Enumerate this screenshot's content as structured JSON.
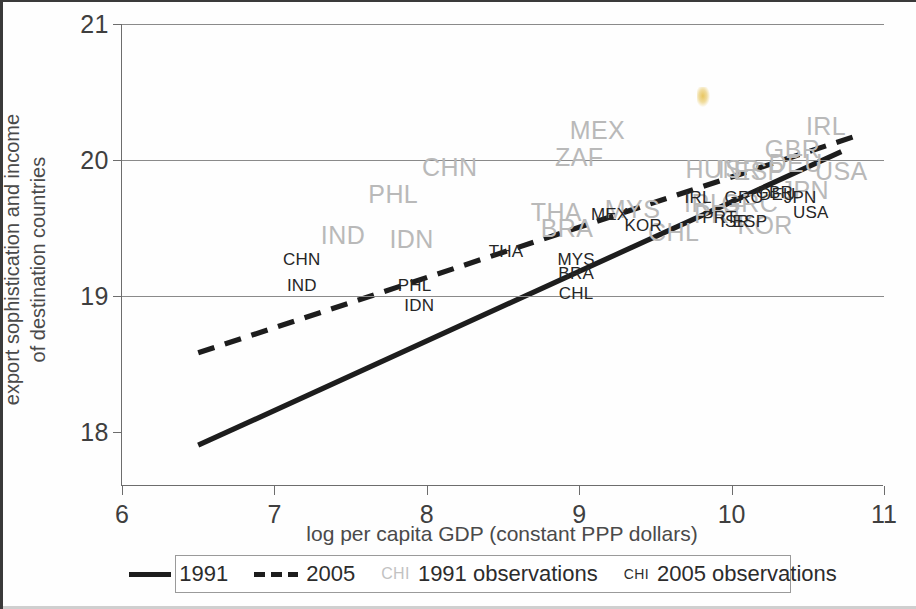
{
  "chart_data": {
    "type": "scatter",
    "title": "",
    "xlabel": "log per capita GDP (constant PPP dollars)",
    "ylabel": "export sophistication and income\nof destination countries",
    "ylabel_line1": "export sophistication and income",
    "ylabel_line2": "of destination countries",
    "xlim": [
      6,
      11
    ],
    "ylim": [
      17.6,
      21
    ],
    "xticks": [
      "6",
      "7",
      "8",
      "9",
      "10",
      "11"
    ],
    "yticks": [
      "18",
      "19",
      "20",
      "21"
    ],
    "gridlines": [
      "19",
      "20",
      "21"
    ],
    "grid": true,
    "legend_position": "below-plot",
    "colors": {
      "series_1991_line": "#1d1d1d",
      "series_2005_line": "#1d1d1d",
      "labels_1991": "#b9b9b9",
      "labels_2005": "#262626",
      "axis": "#6d6d6d",
      "grid": "#8a8a8a",
      "frame": "#3a3a3a"
    },
    "series": [
      {
        "name": "1991",
        "style": "solid",
        "type": "line",
        "x": [
          6.5,
          10.72
        ],
        "y": [
          17.9,
          20.06
        ]
      },
      {
        "name": "2005",
        "style": "dashed",
        "type": "line",
        "x": [
          6.5,
          10.8
        ],
        "y": [
          18.58,
          20.17
        ]
      },
      {
        "name": "1991 observations",
        "type": "text-scatter",
        "color": "#b9b9b9",
        "points": [
          {
            "label": "CHN",
            "x": 8.15,
            "y": 19.95
          },
          {
            "label": "PHL",
            "x": 7.78,
            "y": 19.75
          },
          {
            "label": "IND",
            "x": 7.45,
            "y": 19.45
          },
          {
            "label": "IDN",
            "x": 7.9,
            "y": 19.42
          },
          {
            "label": "MEX",
            "x": 9.12,
            "y": 20.22
          },
          {
            "label": "ZAF",
            "x": 9.0,
            "y": 20.02
          },
          {
            "label": "THA",
            "x": 8.85,
            "y": 19.62
          },
          {
            "label": "BRA",
            "x": 8.92,
            "y": 19.5
          },
          {
            "label": "MYS",
            "x": 9.35,
            "y": 19.64
          },
          {
            "label": "CHL",
            "x": 9.62,
            "y": 19.47
          },
          {
            "label": "IRL",
            "x": 9.82,
            "y": 19.68
          },
          {
            "label": "PRT",
            "x": 9.92,
            "y": 19.6
          },
          {
            "label": "HUN",
            "x": 9.88,
            "y": 19.93
          },
          {
            "label": "ISR",
            "x": 10.05,
            "y": 19.93
          },
          {
            "label": "ESP",
            "x": 10.18,
            "y": 19.92
          },
          {
            "label": "KOR",
            "x": 10.22,
            "y": 19.52
          },
          {
            "label": "GRC",
            "x": 10.12,
            "y": 19.68
          },
          {
            "label": "DEU",
            "x": 10.42,
            "y": 19.98
          },
          {
            "label": "GBR",
            "x": 10.4,
            "y": 20.08
          },
          {
            "label": "IRL",
            "x": 10.62,
            "y": 20.25
          },
          {
            "label": "USA",
            "x": 10.72,
            "y": 19.92
          },
          {
            "label": "JPN",
            "x": 10.48,
            "y": 19.78
          }
        ]
      },
      {
        "name": "2005 observations",
        "type": "text-scatter",
        "color": "#262626",
        "points": [
          {
            "label": "CHN",
            "x": 7.18,
            "y": 19.27
          },
          {
            "label": "IND",
            "x": 7.18,
            "y": 19.08
          },
          {
            "label": "PHL",
            "x": 7.92,
            "y": 19.08
          },
          {
            "label": "IDN",
            "x": 7.95,
            "y": 18.93
          },
          {
            "label": "THA",
            "x": 8.52,
            "y": 19.33
          },
          {
            "label": "MYS",
            "x": 8.98,
            "y": 19.27
          },
          {
            "label": "BRA",
            "x": 8.98,
            "y": 19.17
          },
          {
            "label": "CHL",
            "x": 8.98,
            "y": 19.02
          },
          {
            "label": "MEX",
            "x": 9.2,
            "y": 19.6
          },
          {
            "label": "KOR",
            "x": 9.42,
            "y": 19.52
          },
          {
            "label": "IRL",
            "x": 9.78,
            "y": 19.73
          },
          {
            "label": "PRT",
            "x": 9.92,
            "y": 19.58
          },
          {
            "label": "ISR",
            "x": 10.02,
            "y": 19.55
          },
          {
            "label": "ESP",
            "x": 10.12,
            "y": 19.55
          },
          {
            "label": "GRC",
            "x": 10.08,
            "y": 19.73
          },
          {
            "label": "DEU",
            "x": 10.3,
            "y": 19.75
          },
          {
            "label": "GBR",
            "x": 10.28,
            "y": 19.76
          },
          {
            "label": "JPN",
            "x": 10.45,
            "y": 19.73
          },
          {
            "label": "USA",
            "x": 10.52,
            "y": 19.62
          }
        ]
      }
    ]
  },
  "legend": {
    "items": [
      {
        "swatch": "solid-line",
        "label": "1991"
      },
      {
        "swatch": "dashed-line",
        "label": "2005"
      },
      {
        "swatch": "chi-gray",
        "swatch_text": "CHI",
        "label": "1991 observations"
      },
      {
        "swatch": "chi-dark",
        "swatch_text": "CHI",
        "label": "2005 observations"
      }
    ]
  }
}
